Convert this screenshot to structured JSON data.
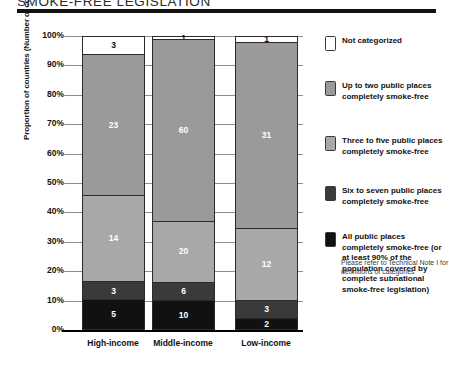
{
  "title": "SMOKE-FREE LEGISLATION",
  "legend": {
    "items": [
      {
        "label": "Not categorized",
        "color": "#ffffff"
      },
      {
        "label": "Up to two public places completely smoke-free",
        "color": "#9a9a9a"
      },
      {
        "label": "Three to five public places completely smoke-free",
        "color": "#a8a8a8"
      },
      {
        "label": "Six to seven public places completely smoke-free",
        "color": "#3a3a3a"
      },
      {
        "label": "All public places completely smoke-free (or at least 90% of the population covered by complete subnational smoke-free legislation)",
        "color": "#111111"
      }
    ],
    "note": "Please refer to Technical Note I for definitions of categories"
  },
  "chart_data": {
    "type": "bar",
    "title": "SMOKE-FREE LEGISLATION",
    "xlabel": "",
    "ylabel": "Proportion of countries (Number of countries inside bars)",
    "ylim": [
      0,
      100
    ],
    "ytick_labels": [
      "100%",
      "90%",
      "80%",
      "70%",
      "60%",
      "50%",
      "40%",
      "30%",
      "20%",
      "10%",
      "0%"
    ],
    "ytick_values": [
      100,
      90,
      80,
      70,
      60,
      50,
      40,
      30,
      20,
      10,
      0
    ],
    "grid": true,
    "stacked": true,
    "units": "count of countries (bar labels); segments sized as percent of column total",
    "legend_position": "right",
    "categories": [
      "High-income",
      "Middle-income",
      "Low-income"
    ],
    "totals": [
      48,
      97,
      49
    ],
    "series": [
      {
        "name": "All public places completely smoke-free (or at least 90% of the population covered by complete subnational smoke-free legislation)",
        "color": "#111111",
        "values": [
          5,
          10,
          2
        ]
      },
      {
        "name": "Six to seven public places completely smoke-free",
        "color": "#3a3a3a",
        "values": [
          3,
          6,
          3
        ]
      },
      {
        "name": "Three to five public places completely smoke-free",
        "color": "#a8a8a8",
        "values": [
          14,
          20,
          12
        ]
      },
      {
        "name": "Up to two public places completely smoke-free",
        "color": "#9a9a9a",
        "values": [
          23,
          60,
          31
        ]
      },
      {
        "name": "Not categorized",
        "color": "#ffffff",
        "values": [
          3,
          1,
          1
        ]
      }
    ],
    "columns": [
      {
        "category": "High-income",
        "total": 48,
        "segments": [
          {
            "name": "Not categorized",
            "value": 3,
            "color": "#ffffff",
            "text_color": "#111111",
            "percent": 6.25
          },
          {
            "name": "Up to two public places completely smoke-free",
            "value": 23,
            "color": "#9a9a9a",
            "text_color": "#ffffff",
            "percent": 47.9
          },
          {
            "name": "Three to five public places completely smoke-free",
            "value": 14,
            "color": "#a8a8a8",
            "text_color": "#ffffff",
            "percent": 29.2
          },
          {
            "name": "Six to seven public places completely smoke-free",
            "value": 3,
            "color": "#3a3a3a",
            "text_color": "#ffffff",
            "percent": 6.25
          },
          {
            "name": "All public places completely smoke-free",
            "value": 5,
            "color": "#111111",
            "text_color": "#ffffff",
            "percent": 10.4
          }
        ]
      },
      {
        "category": "Middle-income",
        "total": 97,
        "segments": [
          {
            "name": "Not categorized",
            "value": 1,
            "color": "#ffffff",
            "text_color": "#111111",
            "percent": 1.0
          },
          {
            "name": "Up to two public places completely smoke-free",
            "value": 60,
            "color": "#9a9a9a",
            "text_color": "#ffffff",
            "percent": 61.9
          },
          {
            "name": "Three to five public places completely smoke-free",
            "value": 20,
            "color": "#a8a8a8",
            "text_color": "#ffffff",
            "percent": 20.6
          },
          {
            "name": "Six to seven public places completely smoke-free",
            "value": 6,
            "color": "#3a3a3a",
            "text_color": "#ffffff",
            "percent": 6.2
          },
          {
            "name": "All public places completely smoke-free",
            "value": 10,
            "color": "#111111",
            "text_color": "#ffffff",
            "percent": 10.3
          }
        ]
      },
      {
        "category": "Low-income",
        "total": 49,
        "segments": [
          {
            "name": "Not categorized",
            "value": 1,
            "color": "#ffffff",
            "text_color": "#111111",
            "percent": 2.0
          },
          {
            "name": "Up to two public places completely smoke-free",
            "value": 31,
            "color": "#9a9a9a",
            "text_color": "#ffffff",
            "percent": 63.3
          },
          {
            "name": "Three to five public places completely smoke-free",
            "value": 12,
            "color": "#a8a8a8",
            "text_color": "#ffffff",
            "percent": 24.5
          },
          {
            "name": "Six to seven public places completely smoke-free",
            "value": 3,
            "color": "#3a3a3a",
            "text_color": "#ffffff",
            "percent": 6.1
          },
          {
            "name": "All public places completely smoke-free",
            "value": 2,
            "color": "#111111",
            "text_color": "#ffffff",
            "percent": 4.1
          }
        ]
      }
    ]
  }
}
